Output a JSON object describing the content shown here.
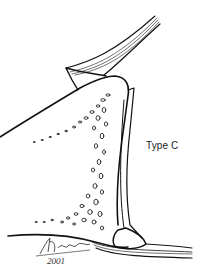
{
  "figure": {
    "label": "Type C",
    "signature": {
      "year": "2001"
    },
    "colors": {
      "line": "#111111",
      "background": "#ffffff"
    }
  }
}
